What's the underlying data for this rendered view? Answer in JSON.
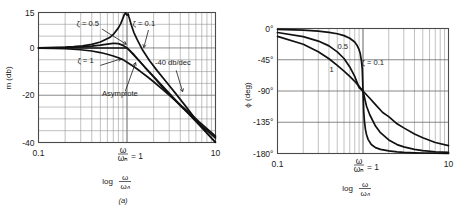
{
  "figure": {
    "caption_a": "(a)",
    "background": "#ffffff",
    "ink": "#111111"
  },
  "chart_data": [
    {
      "type": "line",
      "id": "magnitude-bode",
      "title": "",
      "xlabel": "log ω/ωₙ",
      "ylabel": "m (db)",
      "xscale": "log",
      "xlim": [
        0.1,
        10
      ],
      "ylim": [
        -40,
        15
      ],
      "grid": true,
      "xticks": [
        0.1,
        1,
        10
      ],
      "xtick_labels": [
        "0.1",
        "ω/ωₙ = 1",
        "10"
      ],
      "yticks": [
        15,
        0,
        -20,
        -40
      ],
      "ytick_labels": [
        "15",
        "0",
        "-20",
        "-40"
      ],
      "ytick_minor": [
        10,
        5,
        -5,
        -10,
        -15,
        -25,
        -30,
        -35
      ],
      "legend_position": "inline-annotations",
      "annotations": [
        {
          "text": "ζ = 0.5",
          "x": 0.36,
          "y": 9.5
        },
        {
          "text": "ζ = 0.1",
          "x": 1.55,
          "y": 9.5
        },
        {
          "text": "ζ = 1",
          "x": 0.34,
          "y": -6.5
        },
        {
          "text": "Asymptote",
          "x": 0.83,
          "y": -20.5
        },
        {
          "text": "-40 db/dec",
          "x": 3.3,
          "y": -7.0
        }
      ],
      "series": [
        {
          "name": "ζ = 0.1",
          "zeta": 0.1,
          "x": [
            0.1,
            0.125,
            0.16,
            0.2,
            0.25,
            0.315,
            0.4,
            0.5,
            0.63,
            0.7,
            0.8,
            0.85,
            0.9,
            0.93,
            0.95,
            0.97,
            0.99,
            1.0,
            1.01,
            1.03,
            1.05,
            1.08,
            1.12,
            1.2,
            1.3,
            1.5,
            1.8,
            2.2,
            2.8,
            3.5,
            4.5,
            6.0,
            8.0,
            10.0
          ],
          "values": [
            0.09,
            0.14,
            0.22,
            0.35,
            0.56,
            0.91,
            1.54,
            2.5,
            4.3,
            5.7,
            8.5,
            10.3,
            12.6,
            14.0,
            14.5,
            14.8,
            14.0,
            13.98,
            13.9,
            14.4,
            13.2,
            11.7,
            9.6,
            6.4,
            3.6,
            -0.9,
            -5.4,
            -9.7,
            -14.5,
            -19.0,
            -24.2,
            -30.3,
            -35.9,
            -39.9
          ]
        },
        {
          "name": "ζ = 0.5",
          "zeta": 0.5,
          "x": [
            0.1,
            0.15,
            0.2,
            0.3,
            0.4,
            0.5,
            0.6,
            0.7,
            0.707,
            0.8,
            0.9,
            1.0,
            1.1,
            1.2,
            1.4,
            1.6,
            2.0,
            2.5,
            3.0,
            4.0,
            5.0,
            6.5,
            8.0,
            10.0
          ],
          "values": [
            0.04,
            0.09,
            0.17,
            0.4,
            0.74,
            1.16,
            1.6,
            1.92,
            1.93,
            1.83,
            1.1,
            0.0,
            -1.38,
            -2.86,
            -5.73,
            -8.3,
            -12.3,
            -16.5,
            -19.7,
            -24.4,
            -27.9,
            -32.0,
            -34.9,
            -38.1
          ]
        },
        {
          "name": "ζ = 1",
          "zeta": 1.0,
          "x": [
            0.1,
            0.15,
            0.2,
            0.3,
            0.4,
            0.5,
            0.6,
            0.7,
            0.8,
            0.9,
            1.0,
            1.2,
            1.4,
            1.7,
            2.0,
            2.5,
            3.0,
            4.0,
            5.0,
            6.5,
            8.0,
            10.0
          ],
          "values": [
            -0.09,
            -0.19,
            -0.34,
            -0.75,
            -1.3,
            -1.94,
            -2.65,
            -3.4,
            -4.16,
            -4.93,
            -6.02,
            -7.96,
            -9.77,
            -12.2,
            -14.3,
            -17.4,
            -20.0,
            -24.1,
            -27.3,
            -31.2,
            -34.1,
            -37.3
          ]
        },
        {
          "name": "Asymptote",
          "type": "asymptote",
          "x": [
            0.1,
            1.0,
            10.0
          ],
          "values": [
            0,
            0,
            -40
          ]
        }
      ],
      "slope_note": "-40 db/dec"
    },
    {
      "type": "line",
      "id": "phase-bode",
      "title": "",
      "xlabel": "log ω/ωₙ",
      "ylabel": "ϕ (deg)",
      "xscale": "log",
      "xlim": [
        0.1,
        10
      ],
      "ylim": [
        -180,
        0
      ],
      "grid": true,
      "xticks": [
        0.1,
        1,
        10
      ],
      "xtick_labels": [
        "0.1",
        "ω/ωₙ = 1",
        "10"
      ],
      "yticks": [
        0,
        -45,
        -90,
        -135,
        -180
      ],
      "ytick_labels": [
        "0°",
        "-45°",
        "-90°",
        "-135°",
        "-180°"
      ],
      "legend_position": "inline-annotations",
      "annotations": [
        {
          "text": "0.5",
          "x": 0.58,
          "y": -30
        },
        {
          "text": "1",
          "x": 0.43,
          "y": -62
        },
        {
          "text": "ζ = 0.1",
          "x": 1.3,
          "y": -52
        }
      ],
      "series": [
        {
          "name": "ζ = 0.1",
          "zeta": 0.1,
          "x": [
            0.1,
            0.2,
            0.3,
            0.4,
            0.5,
            0.6,
            0.7,
            0.8,
            0.85,
            0.9,
            0.93,
            0.96,
            0.98,
            1.0,
            1.02,
            1.04,
            1.07,
            1.1,
            1.15,
            1.25,
            1.4,
            1.6,
            2.0,
            2.5,
            3.0,
            4.0,
            5.0,
            7.0,
            10.0
          ],
          "values": [
            -1.2,
            -2.4,
            -3.8,
            -5.5,
            -7.6,
            -10.3,
            -14.0,
            -19.5,
            -24.0,
            -30.5,
            -36.5,
            -47.5,
            -58.5,
            -90.0,
            -120,
            -134,
            -146,
            -153,
            -160,
            -167,
            -171.5,
            -174,
            -176.3,
            -177.6,
            -178.3,
            -179.0,
            -179.3,
            -179.6,
            -179.9
          ]
        },
        {
          "name": "ζ = 0.5",
          "zeta": 0.5,
          "x": [
            0.1,
            0.2,
            0.3,
            0.4,
            0.5,
            0.6,
            0.7,
            0.8,
            0.9,
            1.0,
            1.1,
            1.2,
            1.4,
            1.6,
            2.0,
            2.5,
            3.0,
            4.0,
            5.0,
            7.0,
            10.0
          ],
          "values": [
            -5.8,
            -11.8,
            -18.1,
            -25.0,
            -33.7,
            -43.2,
            -55.3,
            -69.0,
            -85.1,
            -90.0,
            -112.0,
            -124.2,
            -140.5,
            -150.0,
            -160.5,
            -167.2,
            -170.5,
            -174.0,
            -175.8,
            -177.5,
            -178.5
          ]
        },
        {
          "name": "ζ = 1",
          "zeta": 1.0,
          "x": [
            0.1,
            0.2,
            0.3,
            0.4,
            0.5,
            0.6,
            0.7,
            0.8,
            0.9,
            1.0,
            1.2,
            1.4,
            1.7,
            2.0,
            2.5,
            3.0,
            4.0,
            5.0,
            7.0,
            10.0
          ],
          "values": [
            -11.4,
            -22.6,
            -33.4,
            -43.6,
            -53.1,
            -61.4,
            -69.0,
            -76.0,
            -83.3,
            -90.0,
            -100.4,
            -109.6,
            -121.0,
            -126.9,
            -137.2,
            -143.1,
            -151.9,
            -157.4,
            -164.2,
            -168.6
          ]
        }
      ]
    }
  ]
}
